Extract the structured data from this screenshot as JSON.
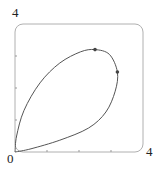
{
  "chart_data": {
    "type": "line",
    "title": "",
    "xlabel": "",
    "ylabel": "",
    "xlim": [
      0,
      4
    ],
    "ylim": [
      0,
      4
    ],
    "grid": false,
    "x_ticks": [
      1,
      2,
      3
    ],
    "y_ticks": [
      1,
      2,
      3
    ],
    "tick_labels": {
      "origin": "0",
      "x_max": "4",
      "y_max": "4"
    },
    "series": [
      {
        "name": "closed loop curve",
        "points": [
          [
            0.0,
            0.0
          ],
          [
            0.05,
            0.5
          ],
          [
            0.28,
            1.3
          ],
          [
            0.78,
            2.16
          ],
          [
            1.4,
            2.78
          ],
          [
            2.05,
            3.13
          ],
          [
            2.5,
            3.2
          ],
          [
            2.95,
            3.05
          ],
          [
            3.2,
            2.5
          ],
          [
            3.13,
            1.9
          ],
          [
            2.84,
            1.25
          ],
          [
            2.3,
            0.75
          ],
          [
            1.4,
            0.37
          ],
          [
            0.5,
            0.1
          ],
          [
            0.0,
            0.0
          ]
        ]
      }
    ],
    "markers": [
      {
        "x": 2.5,
        "y": 3.2
      },
      {
        "x": 3.2,
        "y": 2.5
      }
    ],
    "colors": {
      "curve": "#555555",
      "frame": "#b0b0b0",
      "marker": "#444444"
    }
  }
}
